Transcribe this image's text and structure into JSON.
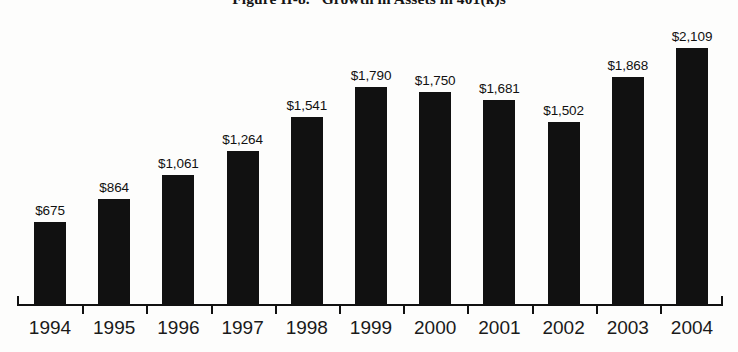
{
  "chart_data": {
    "type": "bar",
    "title": "Figure II-8.   Growth in Assets in 401(k)s",
    "xlabel": "",
    "ylabel": "",
    "categories": [
      "1994",
      "1995",
      "1996",
      "1997",
      "1998",
      "1999",
      "2000",
      "2001",
      "2002",
      "2003",
      "2004"
    ],
    "values": [
      675,
      864,
      1061,
      1264,
      1541,
      1790,
      1750,
      1681,
      1502,
      1868,
      2109
    ],
    "data_labels": [
      "$675",
      "$864",
      "$1,061",
      "$1,264",
      "$1,541",
      "$1,790",
      "$1,750",
      "$1,681",
      "$1,502",
      "$1,868",
      "$2,109"
    ],
    "ylim": [
      0,
      2109
    ],
    "grid": false,
    "legend": null,
    "bar_color": "#111111",
    "background_color": "#fdfdfc",
    "axis_color": "#111111"
  }
}
